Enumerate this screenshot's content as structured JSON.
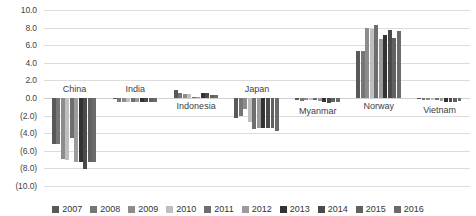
{
  "chart": {
    "title": "",
    "title_fragment": ""
  },
  "chart_data": {
    "type": "bar",
    "title": "",
    "xlabel": "",
    "ylabel": "",
    "ylim": [
      -10.0,
      10.0
    ],
    "ytick_step": 2.0,
    "grid": true,
    "legend_position": "bottom",
    "negative_format": "parentheses",
    "y_tick_labels": [
      "10.0",
      "8.0",
      "6.0",
      "4.0",
      "2.0",
      "0.0",
      "(2.0)",
      "(4.0)",
      "(6.0)",
      "(8.0)",
      "(10.0)"
    ],
    "y_tick_values": [
      10.0,
      8.0,
      6.0,
      4.0,
      2.0,
      0.0,
      -2.0,
      -4.0,
      -6.0,
      -8.0,
      -10.0
    ],
    "categories": [
      "China",
      "India",
      "Indonesia",
      "Japan",
      "Myanmar",
      "Norway",
      "Vietnam"
    ],
    "series": [
      {
        "name": "2007",
        "color": "#595959",
        "values": [
          -5.2,
          -0.1,
          0.9,
          -2.3,
          -0.2,
          5.3,
          -0.1
        ]
      },
      {
        "name": "2008",
        "color": "#767676",
        "values": [
          -5.2,
          -0.5,
          0.6,
          -2.1,
          -0.3,
          5.3,
          -0.2
        ]
      },
      {
        "name": "2009",
        "color": "#8c8c8c",
        "values": [
          -6.9,
          -0.5,
          0.5,
          -1.3,
          -0.2,
          8.0,
          -0.2
        ]
      },
      {
        "name": "2010",
        "color": "#bfbfbf",
        "values": [
          -7.0,
          -0.5,
          0.5,
          -2.7,
          -0.2,
          7.8,
          -0.2
        ]
      },
      {
        "name": "2011",
        "color": "#6e6e6e",
        "values": [
          -4.5,
          -0.5,
          0.1,
          -3.5,
          -0.2,
          8.3,
          -0.2
        ]
      },
      {
        "name": "2012",
        "color": "#9b9b9b",
        "values": [
          -7.3,
          -0.5,
          0.1,
          -3.4,
          -0.3,
          6.7,
          -0.3
        ]
      },
      {
        "name": "2013",
        "color": "#333333",
        "values": [
          -7.3,
          -0.5,
          0.6,
          -3.4,
          -0.5,
          7.2,
          -0.4
        ]
      },
      {
        "name": "2014",
        "color": "#4a4a4a",
        "values": [
          -8.1,
          -0.5,
          0.6,
          -3.4,
          -0.6,
          7.7,
          -0.4
        ]
      },
      {
        "name": "2015",
        "color": "#616161",
        "values": [
          -7.3,
          -0.5,
          0.3,
          -3.4,
          -0.5,
          6.8,
          -0.4
        ]
      },
      {
        "name": "2016",
        "color": "#6b6b6b",
        "values": [
          -7.3,
          -0.5,
          0.3,
          -3.8,
          -0.4,
          7.6,
          -0.3
        ]
      }
    ]
  },
  "legend": {
    "items": [
      "2007",
      "2008",
      "2009",
      "2010",
      "2011",
      "2012",
      "2013",
      "2014",
      "2015",
      "2016"
    ]
  },
  "category_label_offsets": {
    "China": "above",
    "India": "above",
    "Indonesia": "below",
    "Japan": "above",
    "Myanmar": "below",
    "Norway": "below",
    "Vietnam": "below"
  }
}
